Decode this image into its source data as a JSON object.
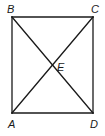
{
  "diagram": {
    "type": "rectangle-with-diagonals",
    "stroke_color": "#1a1a1a",
    "background": "#ffffff",
    "vertices": {
      "A": {
        "label": "A",
        "x": 12,
        "y": 113,
        "label_x": 8,
        "label_y": 128
      },
      "B": {
        "label": "B",
        "x": 12,
        "y": 17,
        "label_x": 7,
        "label_y": 13
      },
      "C": {
        "label": "C",
        "x": 93,
        "y": 17,
        "label_x": 91,
        "label_y": 13
      },
      "D": {
        "label": "D",
        "x": 93,
        "y": 113,
        "label_x": 90,
        "label_y": 128
      }
    },
    "intersection": {
      "label": "E",
      "x": 52.5,
      "y": 65,
      "label_x": 57,
      "label_y": 71
    },
    "segments": [
      {
        "from": "A",
        "to": "B"
      },
      {
        "from": "B",
        "to": "C"
      },
      {
        "from": "C",
        "to": "D"
      },
      {
        "from": "D",
        "to": "A"
      },
      {
        "from": "A",
        "to": "C"
      },
      {
        "from": "B",
        "to": "D"
      }
    ]
  }
}
